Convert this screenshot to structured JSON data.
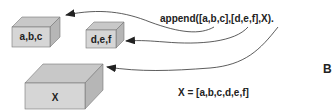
{
  "diagram": {
    "boxes": [
      {
        "id": "box-abc",
        "label": "a,b,c"
      },
      {
        "id": "box-def",
        "label": "d,e,f"
      },
      {
        "id": "box-x",
        "label": "X"
      }
    ],
    "query": "append([a,b,c],[d,e,f],X).",
    "result": "X = [a,b,c,d,e,f]",
    "panel_letter": "B",
    "colors": {
      "box_front": "#d4d4d4",
      "box_top": "#c4c4c4",
      "box_side": "#b8b8b8",
      "stroke": "#555555",
      "arrow": "#222222"
    }
  }
}
